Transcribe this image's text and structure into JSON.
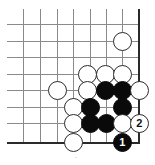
{
  "figure": {
    "kind": "go-board-diagram",
    "width": 155,
    "height": 165,
    "background_color": "#ffffff",
    "caption": "."
  },
  "board": {
    "grid_line_color": "#8a8a8a",
    "edge_line_color": "#2a2a2a",
    "stone_diameter": 19,
    "corner": "bottom-right",
    "x_coords": [
      23,
      40,
      57,
      73,
      90,
      106,
      122,
      138
    ],
    "y_coords": [
      24,
      41,
      57,
      74,
      90,
      107,
      123,
      142
    ],
    "right_edge_x": 138,
    "bottom_edge_y": 142,
    "grid_left": 7,
    "grid_top": 9
  },
  "stones": [
    {
      "id": "w-top-right",
      "color": "white",
      "cx": 122,
      "cy": 41,
      "label": ""
    },
    {
      "id": "w-r4-c5",
      "color": "white",
      "cx": 87,
      "cy": 74,
      "label": ""
    },
    {
      "id": "w-r4-c6",
      "color": "white",
      "cx": 105,
      "cy": 74,
      "label": ""
    },
    {
      "id": "w-r4-c7",
      "color": "white",
      "cx": 122,
      "cy": 74,
      "label": ""
    },
    {
      "id": "w-r5-c3",
      "color": "white",
      "cx": 57,
      "cy": 90,
      "label": ""
    },
    {
      "id": "w-r5-c5",
      "color": "white",
      "cx": 87,
      "cy": 90,
      "label": ""
    },
    {
      "id": "b-r5-c6",
      "color": "black",
      "cx": 105,
      "cy": 90,
      "label": ""
    },
    {
      "id": "b-r5-c7",
      "color": "black",
      "cx": 122,
      "cy": 90,
      "label": ""
    },
    {
      "id": "w-r5-edge",
      "color": "white",
      "cx": 139,
      "cy": 90,
      "label": ""
    },
    {
      "id": "w-r6-c4",
      "color": "white",
      "cx": 73,
      "cy": 107,
      "label": ""
    },
    {
      "id": "b-r6-c5",
      "color": "black",
      "cx": 90,
      "cy": 107,
      "label": ""
    },
    {
      "id": "b-r6-c7",
      "color": "black",
      "cx": 122,
      "cy": 107,
      "label": ""
    },
    {
      "id": "w-r7-c4",
      "color": "white",
      "cx": 73,
      "cy": 123,
      "label": ""
    },
    {
      "id": "b-r7-c5",
      "color": "black",
      "cx": 90,
      "cy": 123,
      "label": ""
    },
    {
      "id": "b-r7-c6",
      "color": "black",
      "cx": 106,
      "cy": 123,
      "label": ""
    },
    {
      "id": "w-r7-c7",
      "color": "white",
      "cx": 122,
      "cy": 123,
      "label": ""
    },
    {
      "id": "w-move-2",
      "color": "white",
      "cx": 139,
      "cy": 123,
      "label": "2"
    },
    {
      "id": "w-r8-c4",
      "color": "white",
      "cx": 73,
      "cy": 142,
      "label": ""
    },
    {
      "id": "b-move-1",
      "color": "black",
      "cx": 122,
      "cy": 142,
      "label": "1"
    }
  ],
  "moves": {
    "black_move_label": "1",
    "white_move_label": "2"
  }
}
